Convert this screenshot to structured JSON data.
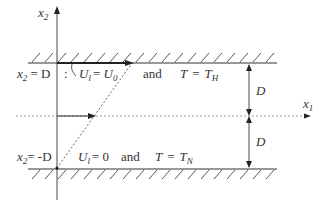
{
  "diagram": {
    "axes": {
      "vertical_label_base": "x",
      "vertical_label_sub": "2",
      "horizontal_label_base": "x",
      "horizontal_label_sub": "1"
    },
    "top_wall": {
      "position_label_pre": "x",
      "position_label_sub": "2",
      "position_label_post": "= D",
      "separator": ":",
      "velocity_var": "U",
      "velocity_sub": "l",
      "velocity_eq": "= ",
      "velocity_value": "U",
      "velocity_value_sub": "0",
      "conjunction": "and",
      "temp_var": "T",
      "temp_eq": "=",
      "temp_value": "T",
      "temp_value_sub": "H"
    },
    "bottom_wall": {
      "position_label_pre": "x",
      "position_label_sub": "2",
      "position_label_post": "= -D",
      "velocity_var": "U",
      "velocity_sub": "l",
      "velocity_eq": "= 0",
      "conjunction": "and",
      "temp_var": "T",
      "temp_eq": "=",
      "temp_value": "T",
      "temp_value_sub": "N"
    },
    "dimensions": {
      "upper_half": "D",
      "lower_half": "D"
    },
    "colors": {
      "line": "#333333",
      "dashed": "#555555"
    }
  }
}
